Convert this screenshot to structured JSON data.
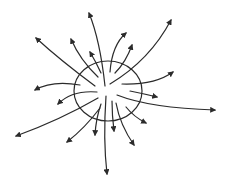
{
  "diagram": {
    "title": "",
    "colors": {
      "stroke": "#2b2b2b",
      "background": "#ffffff"
    },
    "surface": {
      "cx": 108,
      "cy": 91,
      "rx": 34,
      "ry": 30
    },
    "field_lines": [
      {
        "id": "up",
        "d": "M105,86 Q100,40 89,13"
      },
      {
        "id": "up-left-long",
        "d": "M95,86 Q60,60 36,38"
      },
      {
        "id": "up-left",
        "d": "M98,77 Q80,60 71,39"
      },
      {
        "id": "up-left-short",
        "d": "M101,73 Q96,62 90,52"
      },
      {
        "id": "up-right",
        "d": "M110,72 Q112,45 126,33"
      },
      {
        "id": "up-right-2",
        "d": "M115,73 Q126,62 132,45"
      },
      {
        "id": "up-right-long",
        "d": "M110,84 Q150,60 171,20"
      },
      {
        "id": "right",
        "d": "M122,84 Q155,85 173,72"
      },
      {
        "id": "right-short",
        "d": "M130,91 Q145,94 157,97"
      },
      {
        "id": "right-long",
        "d": "M117,95 Q150,108 215,110"
      },
      {
        "id": "lower-right",
        "d": "M126,107 Q134,117 146,123"
      },
      {
        "id": "down-right",
        "d": "M116,103 Q120,125 134,145"
      },
      {
        "id": "down",
        "d": "M112,101 Q112,115 114,131"
      },
      {
        "id": "down-long",
        "d": "M106,96 Q103,140 107,174"
      },
      {
        "id": "down-left",
        "d": "M101,104 Q96,118 95,135"
      },
      {
        "id": "down-left-2",
        "d": "M100,108 Q85,128 67,142"
      },
      {
        "id": "down-left-long",
        "d": "M98,98 Q60,120 16,136"
      },
      {
        "id": "left-lower",
        "d": "M97,92 Q72,90 58,104"
      },
      {
        "id": "left",
        "d": "M80,85 Q52,80 35,90"
      }
    ]
  }
}
